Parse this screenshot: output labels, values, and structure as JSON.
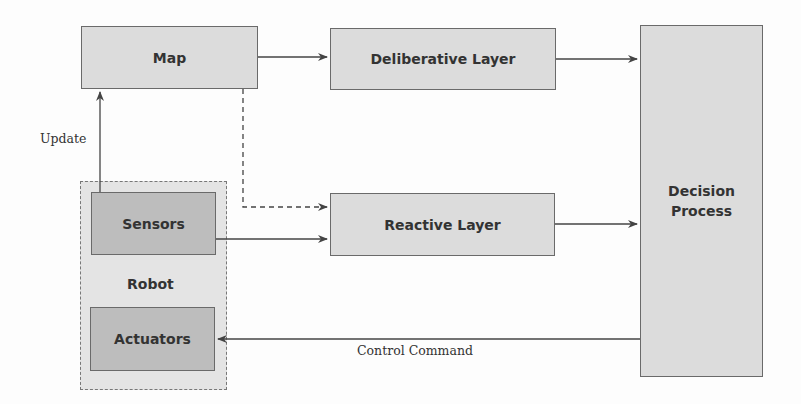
{
  "diagram": {
    "nodes": {
      "map": "Map",
      "deliberative": "Deliberative Layer",
      "reactive": "Reactive Layer",
      "decision_line1": "Decision",
      "decision_line2": "Process",
      "sensors": "Sensors",
      "actuators": "Actuators",
      "robot": "Robot"
    },
    "edges": [
      {
        "from": "Map",
        "to": "Deliberative Layer",
        "style": "solid"
      },
      {
        "from": "Map",
        "to": "Reactive Layer",
        "style": "dashed"
      },
      {
        "from": "Sensors",
        "to": "Map",
        "style": "solid",
        "label": "Update"
      },
      {
        "from": "Sensors",
        "to": "Reactive Layer",
        "style": "solid"
      },
      {
        "from": "Deliberative Layer",
        "to": "Decision Process",
        "style": "solid"
      },
      {
        "from": "Reactive Layer",
        "to": "Decision Process",
        "style": "solid"
      },
      {
        "from": "Decision Process",
        "to": "Actuators",
        "style": "solid",
        "label": "Control Command"
      }
    ],
    "labels": {
      "update": "Update",
      "control_command": "Control Command"
    },
    "colors": {
      "box_fill": "#dcdcdc",
      "dark_box_fill": "#bdbdbd",
      "robot_fill": "#e4e4e4",
      "stroke": "#444444"
    }
  }
}
